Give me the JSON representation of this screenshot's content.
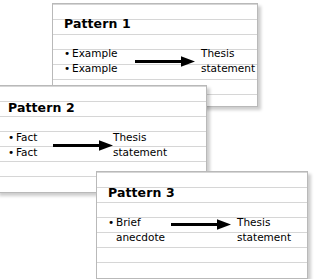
{
  "diagram": {
    "type": "thesis-pattern-cards",
    "card_count": 3,
    "colors": {
      "card_background": "#ffffff",
      "card_border": "#b9b9b9",
      "rule_line": "#d6d6d6",
      "text": "#000000",
      "arrow": "#000000",
      "shadow": "rgba(0,0,0,0.20)"
    },
    "cards": [
      {
        "id": "pattern-1",
        "title": "Pattern 1",
        "premises": [
          {
            "text": "Example",
            "bullet": true
          },
          {
            "text": "Example",
            "bullet": true
          }
        ],
        "arrow": {
          "name": "right-arrow",
          "direction": "right"
        },
        "thesis": [
          "Thesis",
          "statement"
        ]
      },
      {
        "id": "pattern-2",
        "title": "Pattern 2",
        "premises": [
          {
            "text": "Fact",
            "bullet": true
          },
          {
            "text": "Fact",
            "bullet": true
          }
        ],
        "arrow": {
          "name": "right-arrow",
          "direction": "right"
        },
        "thesis": [
          "Thesis",
          "statement"
        ]
      },
      {
        "id": "pattern-3",
        "title": "Pattern 3",
        "premises": [
          {
            "text": "Brief",
            "bullet": true
          },
          {
            "text": "anecdote",
            "bullet": false
          }
        ],
        "arrow": {
          "name": "right-arrow",
          "direction": "right"
        },
        "thesis": [
          "Thesis",
          "statement"
        ]
      }
    ]
  }
}
